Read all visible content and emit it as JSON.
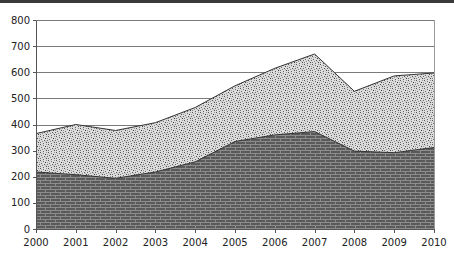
{
  "chart_data": {
    "type": "area",
    "stacked": false,
    "title": "",
    "xlabel": "",
    "ylabel": "",
    "x": [
      2000,
      2001,
      2002,
      2003,
      2004,
      2005,
      2006,
      2007,
      2008,
      2009,
      2010
    ],
    "series": [
      {
        "name": "Upper series (stipple)",
        "pattern": "stipple",
        "values": [
          365,
          400,
          377,
          407,
          465,
          548,
          615,
          670,
          527,
          586,
          597
        ]
      },
      {
        "name": "Lower series (brick)",
        "pattern": "brick",
        "values": [
          218,
          208,
          194,
          218,
          257,
          335,
          360,
          373,
          298,
          292,
          312
        ]
      }
    ],
    "ylim": [
      0,
      800
    ],
    "yticks": [
      0,
      100,
      200,
      300,
      400,
      500,
      600,
      700,
      800
    ],
    "xtick_labels": [
      "2000",
      "2001",
      "2002",
      "2003",
      "2004",
      "2005",
      "2006",
      "2007",
      "2008",
      "2009",
      "2010"
    ],
    "ytick_labels": [
      "0",
      "100",
      "200",
      "300",
      "400",
      "500",
      "600",
      "700",
      "800"
    ],
    "grid": true,
    "legend": "none",
    "colors": {
      "grid": "#7a7a7a",
      "axis": "#555555",
      "brick": "#575757",
      "mortar": "#8a8a8a",
      "stipple_bg": "#d8d8d8",
      "stipple_dot": "#555555",
      "outline": "#333333"
    }
  }
}
